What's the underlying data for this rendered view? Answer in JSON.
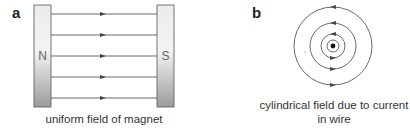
{
  "figure": {
    "panels": [
      {
        "id": "a",
        "label": "a",
        "caption": "uniform field of magnet",
        "magnet": {
          "left_pole": "N",
          "right_pole": "S"
        },
        "field_lines": 5,
        "arrow_direction": "N to S (right)"
      },
      {
        "id": "b",
        "label": "b",
        "caption_line1": "cylindrical field due to current",
        "caption_line2": "in wire",
        "wire_symbol": "current out of page (dot)",
        "circle_count": 4,
        "arrow_direction": "counter-clockwise"
      }
    ],
    "colors": {
      "line": "#444444",
      "magnet_light": "#ededed",
      "magnet_dark": "#a9a9a9",
      "magnet_border": "#555555",
      "text": "#333333"
    }
  }
}
